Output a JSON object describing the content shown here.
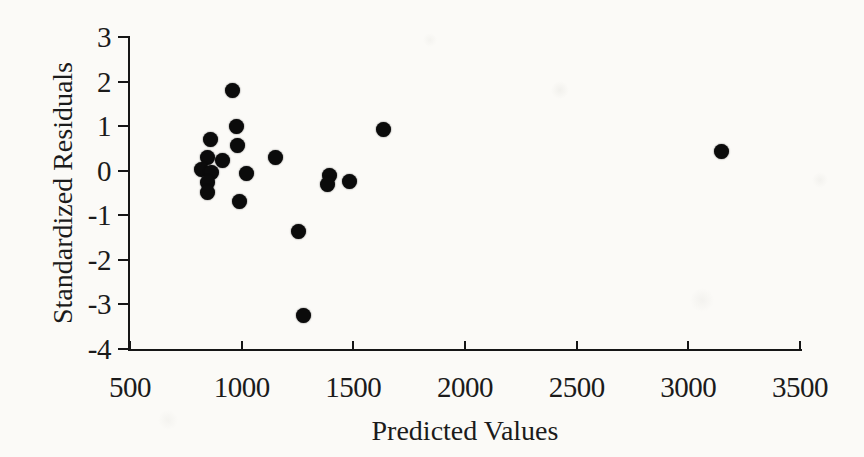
{
  "chart_data": {
    "type": "scatter",
    "title": "",
    "xlabel": "Predicted Values",
    "ylabel": "Standardized Residuals",
    "xlim": [
      500,
      3500
    ],
    "ylim": [
      -4,
      3
    ],
    "x_ticks": [
      "500",
      "1000",
      "1500",
      "2000",
      "2500",
      "3000",
      "3500"
    ],
    "x_tick_values": [
      500,
      1000,
      1500,
      2000,
      2500,
      3000,
      3500
    ],
    "y_ticks": [
      "3",
      "2",
      "1",
      "0",
      "-1",
      "-2",
      "-3",
      "-4"
    ],
    "y_tick_values": [
      3,
      2,
      1,
      0,
      -1,
      -2,
      -3,
      -4
    ],
    "grid": false,
    "legend": null,
    "marker": {
      "shape": "circle",
      "diameter_px": 15,
      "color": "#0b0b0b"
    },
    "axis_color": "#161616",
    "background_color": "#fbfaf7",
    "points": [
      {
        "x": 957,
        "y": 1.8
      },
      {
        "x": 979,
        "y": 1.0
      },
      {
        "x": 861,
        "y": 0.7
      },
      {
        "x": 983,
        "y": 0.57
      },
      {
        "x": 1150,
        "y": 0.3
      },
      {
        "x": 845,
        "y": 0.3
      },
      {
        "x": 912,
        "y": 0.24
      },
      {
        "x": 822,
        "y": 0.03
      },
      {
        "x": 863,
        "y": -0.03
      },
      {
        "x": 1022,
        "y": -0.07
      },
      {
        "x": 849,
        "y": -0.26
      },
      {
        "x": 845,
        "y": -0.48
      },
      {
        "x": 989,
        "y": -0.7
      },
      {
        "x": 1395,
        "y": -0.1
      },
      {
        "x": 1385,
        "y": -0.3
      },
      {
        "x": 1485,
        "y": -0.25
      },
      {
        "x": 1635,
        "y": 0.93
      },
      {
        "x": 1256,
        "y": -1.37
      },
      {
        "x": 1276,
        "y": -3.25
      },
      {
        "x": 3148,
        "y": 0.44
      }
    ]
  }
}
